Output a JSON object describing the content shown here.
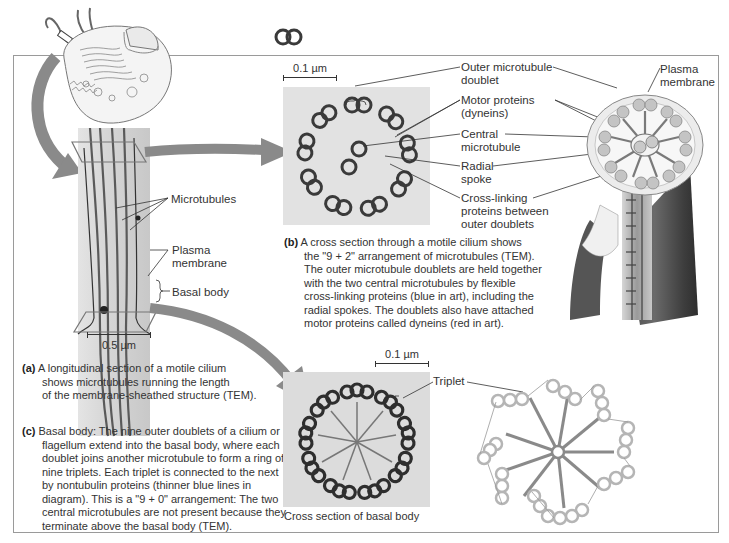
{
  "figure": {
    "colors": {
      "frame": "#9a9a9a",
      "arrow": "#8a8a8a",
      "tem_bg": "#d8d8d8",
      "tem_dark": "#3a3a3a",
      "art_tube": "#bdbdbd",
      "art_spoke": "#7a7a7a",
      "text": "#333333"
    }
  },
  "panel_a": {
    "scale_label": "0.5 µm",
    "labels": {
      "microtubules": "Microtubules",
      "plasma_membrane_1": "Plasma",
      "plasma_membrane_2": "membrane",
      "basal_body": "Basal body"
    },
    "caption_letter": "(a)",
    "caption_lines": [
      "A longitudinal section of a motile cilium",
      "shows microtubules running the length",
      "of the membrane-sheathed structure (TEM)."
    ]
  },
  "panel_b": {
    "scale_label": "0.1 µm",
    "labels": {
      "outer_doublet_1": "Outer microtubule",
      "outer_doublet_2": "doublet",
      "motor_proteins_1": "Motor proteins",
      "motor_proteins_2": "(dyneins)",
      "central_mt_1": "Central",
      "central_mt_2": "microtubule",
      "radial_spoke_1": "Radial",
      "radial_spoke_2": "spoke",
      "cross_linking_1": "Cross-linking",
      "cross_linking_2": "proteins between",
      "cross_linking_3": "outer doublets",
      "plasma_membrane_1": "Plasma",
      "plasma_membrane_2": "membrane"
    },
    "caption_letter": "(b)",
    "caption_lines": [
      "A cross section through a motile cilium shows",
      "the \"9 + 2\" arrangement of microtubules (TEM).",
      "The outer microtubule doublets are held together",
      "with the two central microtubules by flexible",
      "cross-linking proteins (blue in art), including the",
      "radial spokes. The doublets also have attached",
      "motor proteins called dyneins (red in art)."
    ]
  },
  "panel_c": {
    "scale_label": "0.1 µm",
    "labels": {
      "triplet": "Triplet",
      "cross_section": "Cross section of basal body"
    },
    "caption_letter": "(c)",
    "caption_lines": [
      "Basal body: The nine outer doublets of a cilium or",
      "flagellum extend into the basal body, where each",
      "doublet joins another microtubule to form a ring of",
      "nine triplets. Each triplet is connected to the next",
      "by nontubulin proteins (thinner blue lines in",
      "diagram). This is a \"9 + 0\" arrangement: The two",
      "central microtubules are not present because they",
      "terminate above the basal body (TEM)."
    ]
  }
}
